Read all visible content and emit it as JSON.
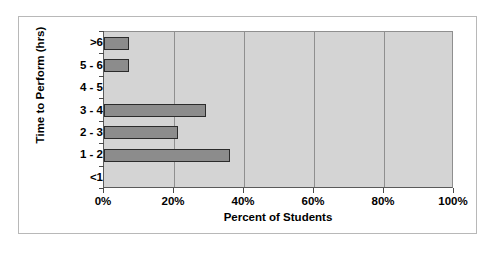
{
  "chart_data": {
    "type": "bar",
    "orientation": "horizontal",
    "title": "",
    "xlabel": "Percent of Students",
    "ylabel": "Time to Perform (hrs)",
    "categories": [
      ">6",
      "5 - 6",
      "4 - 5",
      "3 - 4",
      "2 - 3",
      "1 - 2",
      "<1"
    ],
    "values": [
      7,
      7,
      0,
      29,
      21,
      36,
      0
    ],
    "xlim": [
      0,
      100
    ],
    "xticks": [
      0,
      20,
      40,
      60,
      80,
      100
    ],
    "xtick_labels": [
      "0%",
      "20%",
      "40%",
      "60%",
      "80%",
      "100%"
    ],
    "grid": "vertical",
    "legend": "none",
    "plot_background": "#d4d4d4",
    "bar_color": "#8c8c8c",
    "bar_border_color": "#2b2b2b",
    "figure_background": "#ffffff",
    "figure_border_color": "#b8b8b8"
  }
}
